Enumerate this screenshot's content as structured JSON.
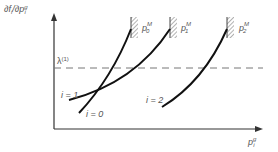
{
  "diagram": {
    "y_axis_label": {
      "main": "∂f",
      "sub_i": "i",
      "slash": "/∂p",
      "sup": "g",
      "sub": "i"
    },
    "x_axis_label": {
      "main": "p",
      "sup": "g",
      "sub": "i"
    },
    "threshold": {
      "symbol": "λ",
      "sup": "(1)"
    },
    "curves": [
      {
        "label": "i = 0",
        "limit": {
          "main": "p",
          "sub": "0",
          "sup": "M"
        }
      },
      {
        "label": "i = 1",
        "limit": {
          "main": "p",
          "sub": "1",
          "sup": "M"
        }
      },
      {
        "label": "i = 2",
        "limit": {
          "main": "p",
          "sub": "2",
          "sup": "M"
        }
      }
    ],
    "colors": {
      "curve": "#111111",
      "axis": "#333333",
      "dashed": "#777777",
      "text": "#555555"
    }
  }
}
